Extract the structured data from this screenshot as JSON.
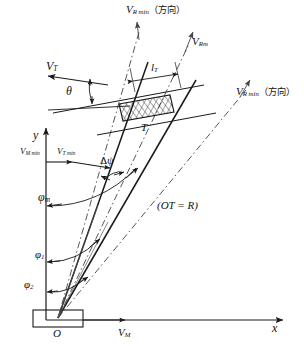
{
  "figure": {
    "type": "vector-kinematics-diagram",
    "background_color": "#ffffff",
    "line_color": "#1a1a1a",
    "dash_color": "#555555",
    "axes": {
      "origin_label": "O",
      "x_label": "x",
      "y_label": "y"
    },
    "labels": {
      "v_t": "V",
      "v_t_sub": "T",
      "v_m": "V",
      "v_m_sub": "M",
      "v_rel": "V",
      "v_rel_sub": "Rm",
      "v_r_min_top": "V",
      "v_r_min_top_sub": "R min",
      "v_r_min_top_cn": "（方向）",
      "v_r_min_right": "V",
      "v_r_min_right_sub": "R min",
      "v_r_min_right_cn": "（方向）",
      "v_m_min": "V",
      "v_m_min_sub": "M min",
      "v_t_min": "V",
      "v_t_min_sub": "T min",
      "theta": "θ",
      "phi_m": "φ",
      "phi_m_sub": "m",
      "phi_1": "φ",
      "phi_1_sub": "1",
      "phi_2": "φ",
      "phi_2_sub": "2",
      "delta_psi_delta": "Δ",
      "delta_psi_psi": "ψ",
      "l_t": "l",
      "l_t_sub": "T",
      "target_point": "T",
      "ot_relation": "(OT = R)"
    }
  }
}
